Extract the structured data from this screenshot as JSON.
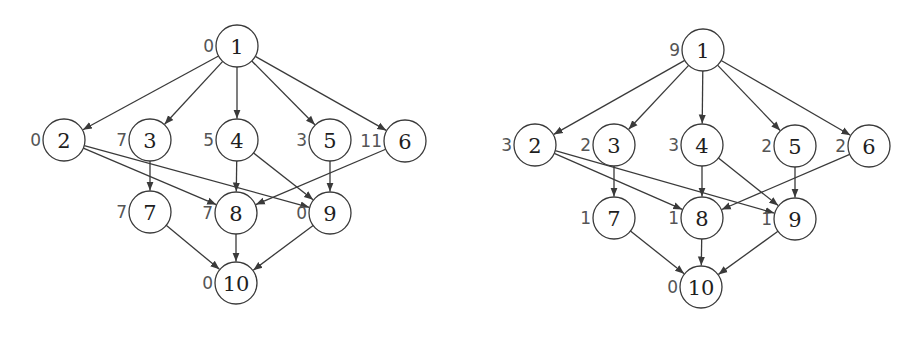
{
  "graphs": [
    {
      "id": "left",
      "node_radius": 21,
      "nodes": [
        {
          "id": "1",
          "label": "1",
          "weight": "0",
          "x": 237,
          "y": 46
        },
        {
          "id": "2",
          "label": "2",
          "weight": "0",
          "x": 64,
          "y": 140
        },
        {
          "id": "3",
          "label": "3",
          "weight": "7",
          "x": 150,
          "y": 140
        },
        {
          "id": "4",
          "label": "4",
          "weight": "5",
          "x": 237,
          "y": 140
        },
        {
          "id": "5",
          "label": "5",
          "weight": "3",
          "x": 330,
          "y": 140
        },
        {
          "id": "6",
          "label": "6",
          "weight": "11",
          "x": 405,
          "y": 141
        },
        {
          "id": "7",
          "label": "7",
          "weight": "7",
          "x": 150,
          "y": 212
        },
        {
          "id": "8",
          "label": "8",
          "weight": "7",
          "x": 236,
          "y": 213
        },
        {
          "id": "9",
          "label": "9",
          "weight": "0",
          "x": 330,
          "y": 213
        },
        {
          "id": "10",
          "label": "10",
          "weight": "0",
          "x": 236,
          "y": 283
        }
      ],
      "edges": [
        [
          "1",
          "2"
        ],
        [
          "1",
          "3"
        ],
        [
          "1",
          "4"
        ],
        [
          "1",
          "5"
        ],
        [
          "1",
          "6"
        ],
        [
          "2",
          "8"
        ],
        [
          "2",
          "9"
        ],
        [
          "3",
          "7"
        ],
        [
          "4",
          "8"
        ],
        [
          "4",
          "9"
        ],
        [
          "5",
          "9"
        ],
        [
          "6",
          "8"
        ],
        [
          "7",
          "10"
        ],
        [
          "8",
          "10"
        ],
        [
          "9",
          "10"
        ]
      ]
    },
    {
      "id": "right",
      "node_radius": 21,
      "nodes": [
        {
          "id": "1",
          "label": "1",
          "weight": "9",
          "x": 703,
          "y": 50
        },
        {
          "id": "2",
          "label": "2",
          "weight": "3",
          "x": 535,
          "y": 145
        },
        {
          "id": "3",
          "label": "3",
          "weight": "2",
          "x": 614,
          "y": 145
        },
        {
          "id": "4",
          "label": "4",
          "weight": "3",
          "x": 702,
          "y": 145
        },
        {
          "id": "5",
          "label": "5",
          "weight": "2",
          "x": 795,
          "y": 146
        },
        {
          "id": "6",
          "label": "6",
          "weight": "2",
          "x": 869,
          "y": 146
        },
        {
          "id": "7",
          "label": "7",
          "weight": "1",
          "x": 614,
          "y": 218
        },
        {
          "id": "8",
          "label": "8",
          "weight": "1",
          "x": 702,
          "y": 218
        },
        {
          "id": "9",
          "label": "9",
          "weight": "1",
          "x": 795,
          "y": 219
        },
        {
          "id": "10",
          "label": "10",
          "weight": "0",
          "x": 701,
          "y": 287
        }
      ],
      "edges": [
        [
          "1",
          "2"
        ],
        [
          "1",
          "3"
        ],
        [
          "1",
          "4"
        ],
        [
          "1",
          "5"
        ],
        [
          "1",
          "6"
        ],
        [
          "2",
          "8"
        ],
        [
          "2",
          "9"
        ],
        [
          "3",
          "7"
        ],
        [
          "4",
          "8"
        ],
        [
          "4",
          "9"
        ],
        [
          "5",
          "9"
        ],
        [
          "6",
          "8"
        ],
        [
          "7",
          "10"
        ],
        [
          "8",
          "10"
        ],
        [
          "9",
          "10"
        ]
      ]
    }
  ],
  "colors": {
    "background": "#ffffff",
    "stroke": "#3a3a3a",
    "node_text": "#1e1e1e",
    "weight_text": "#555555"
  }
}
